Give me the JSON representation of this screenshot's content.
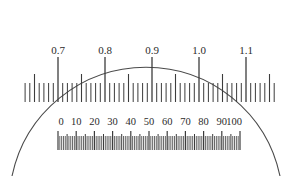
{
  "instrument": {
    "name": "reticle-scale-viewfield",
    "background_color": "#ffffff",
    "stroke_color": "#3c3c3c",
    "text_color": "#2b2b2b"
  },
  "field_arc": {
    "name": "field-of-view-arc",
    "stroke_color": "#4a4a4a",
    "stroke_width": 1.1,
    "apex_x": 146,
    "apex_y": 11,
    "left_foot_x": 12,
    "right_foot_x": 280,
    "bottom_y": 176
  },
  "upper_scale": {
    "name": "upper-scale",
    "baseline_y": 102,
    "labels": [
      "0.7",
      "0.8",
      "0.9",
      "1.0",
      "1.1"
    ],
    "label_values": [
      0.7,
      0.8,
      0.9,
      1.0,
      1.1
    ],
    "label_y": 54,
    "major_x": [
      58,
      105,
      152,
      199,
      246
    ],
    "major_tick_top_y": 57,
    "medium_tick_top_y": 74,
    "minor_tick_top_y": 83,
    "spacing": 47,
    "subdivisions_per_major": 10,
    "minor_step": 4.7,
    "extent_left_x": 25,
    "extent_right_x": 278
  },
  "lower_scale": {
    "name": "lower-scale",
    "labels": [
      "0",
      "10",
      "20",
      "30",
      "40",
      "50",
      "60",
      "70",
      "80",
      "90",
      "100"
    ],
    "label_values": [
      0,
      10,
      20,
      30,
      40,
      50,
      60,
      70,
      80,
      90,
      100
    ],
    "label_y": 125,
    "start_x": 58,
    "end_x": 240,
    "spacing": 18.2,
    "bar_top_y": 131,
    "bar_bottom_y": 150,
    "major_tick_top_y": 131,
    "medium_tick_top_y": 134,
    "minor_tick_top_y": 136,
    "subdivisions_per_decade": 10,
    "minor_step": 1.82
  },
  "chart_data": {
    "type": "table",
    "series": [
      {
        "name": "upper-scale",
        "unit": "mm",
        "tick_labels": [
          "0.7",
          "0.8",
          "0.9",
          "1.0",
          "1.1"
        ],
        "values": [
          0.7,
          0.8,
          0.9,
          1.0,
          1.1
        ],
        "range": [
          0.7,
          1.1
        ],
        "minor_division": 0.02,
        "medium_division": 0.05
      },
      {
        "name": "lower-scale",
        "unit": "divisions",
        "tick_labels": [
          "0",
          "10",
          "20",
          "30",
          "40",
          "50",
          "60",
          "70",
          "80",
          "90",
          "100"
        ],
        "values": [
          0,
          10,
          20,
          30,
          40,
          50,
          60,
          70,
          80,
          90,
          100
        ],
        "range": [
          0,
          100
        ],
        "minor_division": 1,
        "medium_division": 5
      }
    ],
    "xlabel": "",
    "ylabel": "",
    "grid": false,
    "legend": "none"
  }
}
